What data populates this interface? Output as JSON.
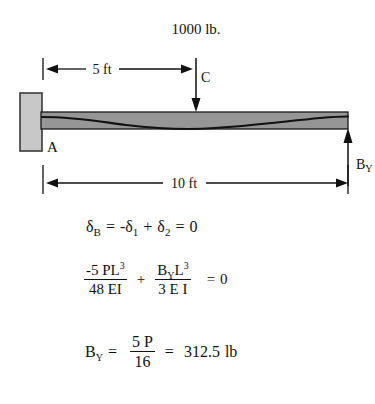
{
  "figure": {
    "load_label": "1000 lb.",
    "point_c_label": "C",
    "point_a_label": "A",
    "reaction_label": "B",
    "reaction_label_sub": "Y",
    "dimension_half": "5 ft",
    "dimension_full": "10 ft",
    "colors": {
      "beam_fill": "#969696",
      "beam_stroke": "#1a1a1a",
      "wall_fill": "#c8c8c8",
      "wall_stroke": "#3a3a3a",
      "line": "#111111",
      "background": "#ffffff"
    }
  },
  "equations": {
    "line1": {
      "delta": "δ",
      "sub_b": "B",
      "eq": "=",
      "minus_delta": "-δ",
      "sub_1": "1",
      "plus": "+",
      "delta2": "δ",
      "sub_2": "2",
      "eq2": "=",
      "zero": "0"
    },
    "line2": {
      "num1": "-5 PL",
      "num1_sup": "3",
      "den1": "48 EI",
      "plus": "+",
      "num2_b": "B",
      "num2_sub": "Y",
      "num2_l": "L",
      "num2_sup": "3",
      "den2": "3 E I",
      "equals": "=",
      "zero": "0"
    },
    "line3": {
      "by": "B",
      "by_sub": "Y",
      "equals": "=",
      "num": "5 P",
      "den": "16",
      "equals2": "=",
      "result": "312.5",
      "unit": "lb"
    }
  }
}
